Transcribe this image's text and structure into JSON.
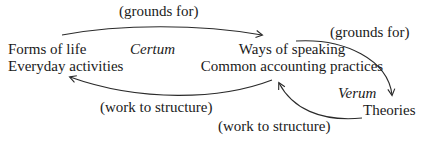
{
  "diagram": {
    "nodes": {
      "left": {
        "line1": "Forms of life",
        "line2": "Everyday activities"
      },
      "middle": {
        "line1": "Ways of speaking",
        "line2": "Common accounting practices"
      },
      "right": {
        "line1": "Theories"
      }
    },
    "regions": {
      "certum": "Certum",
      "verum": "Verum"
    },
    "edges": [
      {
        "from": "left",
        "to": "middle",
        "label": "(grounds for)"
      },
      {
        "from": "middle",
        "to": "right",
        "label": "(grounds for)"
      },
      {
        "from": "middle",
        "to": "left",
        "label": "(work to structure)"
      },
      {
        "from": "right",
        "to": "middle",
        "label": "(work to structure)"
      }
    ],
    "colors": {
      "text": "#1a1a1a",
      "line": "#2a2a2a",
      "background": "#ffffff"
    }
  }
}
